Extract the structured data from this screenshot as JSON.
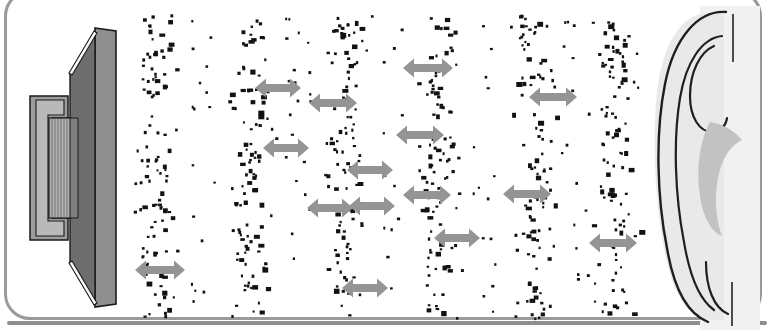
{
  "figure": {
    "description": "Cross-section of a loudspeaker on the left emits longitudinal sound waves, drawn as alternating dense bands (compressions) and sparse gaps (rarefactions) of black air-particle dots, which travel rightwards to a human ear. Grey double-headed arrows indicate the wavelength between successive compressions.",
    "background_color": "#ffffff",
    "frame_color": "#9a9a9a",
    "dot_color": "#121212",
    "arrow_color": "#949494"
  },
  "speaker": {
    "label": "loudspeaker-cross-section",
    "parts": [
      {
        "name": "front-baffle-plate",
        "color": "#8c8c8c"
      },
      {
        "name": "diaphragm-cone",
        "color": "#6e6e6e"
      },
      {
        "name": "magnet-body",
        "color": "#9d9d9d"
      },
      {
        "name": "voice-coil",
        "color": "#a8a8a8"
      },
      {
        "name": "surround-suspension",
        "color": "#f2f2f2"
      },
      {
        "name": "outline",
        "color": "#1a1a1a"
      }
    ]
  },
  "ear": {
    "label": "human-ear-outline",
    "parts": [
      {
        "name": "pinna-fill",
        "color": "#e9e9e9"
      },
      {
        "name": "concha-shadow",
        "color": "#bdbdbd"
      },
      {
        "name": "helix-outline",
        "color": "#1f1f1f"
      }
    ]
  },
  "wave_field": {
    "band_label": "compression-band",
    "gap_label": "rarefaction-gap",
    "band_count": 6,
    "band_centers_px": [
      156,
      250,
      344,
      437,
      531,
      614
    ],
    "band_half_width_px": 30,
    "dots_per_band": 105,
    "field_top_px": 14,
    "field_bottom_px": 318,
    "field_left_px": 122,
    "field_right_px": 648
  },
  "wavelength_arrows": {
    "label": "wavelength-arrow",
    "count": 14,
    "items": [
      {
        "x": 160,
        "y": 270,
        "length": 50
      },
      {
        "x": 278,
        "y": 88,
        "length": 46
      },
      {
        "x": 286,
        "y": 148,
        "length": 46
      },
      {
        "x": 333,
        "y": 103,
        "length": 48
      },
      {
        "x": 370,
        "y": 170,
        "length": 46
      },
      {
        "x": 330,
        "y": 208,
        "length": 46
      },
      {
        "x": 372,
        "y": 206,
        "length": 46
      },
      {
        "x": 365,
        "y": 288,
        "length": 46
      },
      {
        "x": 428,
        "y": 68,
        "length": 50
      },
      {
        "x": 420,
        "y": 135,
        "length": 48
      },
      {
        "x": 427,
        "y": 195,
        "length": 48
      },
      {
        "x": 457,
        "y": 238,
        "length": 46
      },
      {
        "x": 553,
        "y": 97,
        "length": 48
      },
      {
        "x": 527,
        "y": 194,
        "length": 48
      },
      {
        "x": 613,
        "y": 243,
        "length": 48
      }
    ]
  }
}
